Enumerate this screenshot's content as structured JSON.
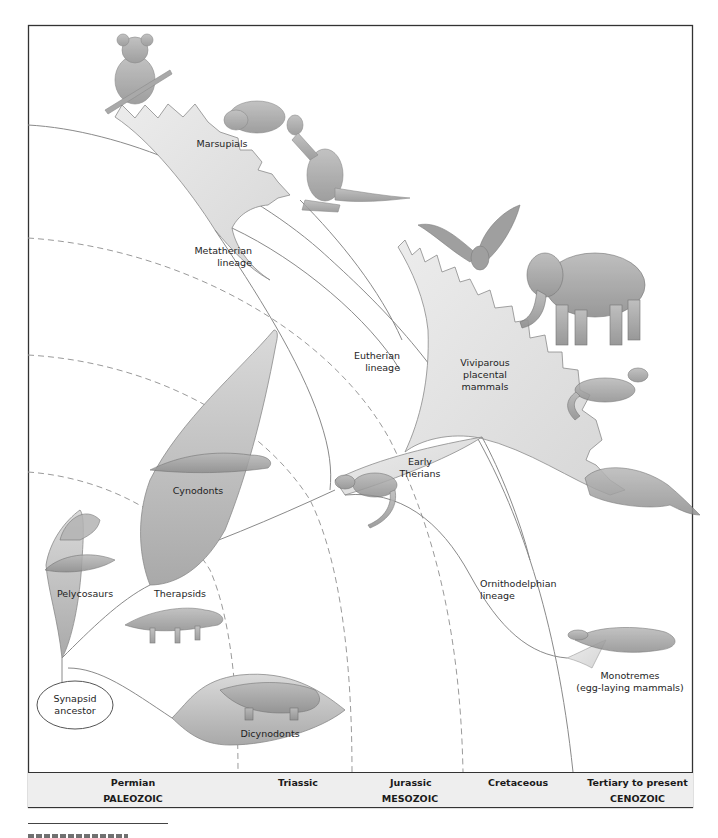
{
  "diagram": {
    "type": "phylogenetic-tree",
    "root": {
      "label": "Synapsid ancestor",
      "lines": [
        "Synapsid",
        "ancestor"
      ]
    },
    "groups": {
      "pelycosaurs": "Pelycosaurs",
      "therapsids": "Therapsids",
      "cynodonts": "Cynodonts",
      "dicynodonts": "Dicynodonts",
      "early_therians": {
        "lines": [
          "Early",
          "Therians"
        ]
      },
      "marsupials": "Marsupials",
      "placentals": {
        "lines": [
          "Viviparous",
          "placental",
          "mammals"
        ]
      },
      "monotremes": {
        "lines": [
          "Monotremes",
          "(egg-laying mammals)"
        ]
      }
    },
    "lineages": {
      "metatherian": {
        "lines": [
          "Metatherian",
          "lineage"
        ]
      },
      "eutherian": {
        "lines": [
          "Eutherian",
          "lineage"
        ]
      },
      "ornithodelphian": {
        "lines": [
          "Ornithodelphian",
          "lineage"
        ]
      }
    },
    "illustrations": [
      "koala",
      "wombat",
      "kangaroo",
      "bat",
      "elephant",
      "ferret",
      "manatee",
      "early-therian-shrew",
      "cynodont-reptile",
      "dimetrodon",
      "therapsid-reptile",
      "dicynodont-reptile",
      "platypus"
    ]
  },
  "timeline": {
    "eras": [
      {
        "era": "PALEOZOIC",
        "periods": [
          "Permian"
        ]
      },
      {
        "era": "MESOZOIC",
        "periods": [
          "Triassic",
          "Jurassic",
          "Cretaceous"
        ]
      },
      {
        "era": "CENOZOIC",
        "periods": [
          "Tertiary to present"
        ]
      }
    ]
  },
  "colors": {
    "frame": "#333333",
    "fill_light": "#e6e6e6",
    "fill_mid": "#c9c9c9",
    "line": "#8a8a8a",
    "dash": "#9a9a9a",
    "table_bg": "#eeeeee"
  }
}
